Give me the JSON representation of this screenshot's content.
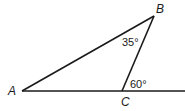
{
  "diagram": {
    "type": "geometry-triangle",
    "vertices": {
      "A": {
        "label": "A",
        "x": 22,
        "y": 91
      },
      "B": {
        "label": "B",
        "x": 154,
        "y": 16
      },
      "C": {
        "label": "C",
        "x": 122,
        "y": 91
      }
    },
    "segments": [
      {
        "from": "A",
        "to": "B"
      },
      {
        "from": "B",
        "to": "C"
      },
      {
        "from": "A",
        "to": "extension",
        "note": "line through A and C extended to the right"
      }
    ],
    "angles": [
      {
        "at": "B",
        "label": "35°",
        "description": "interior angle ABC"
      },
      {
        "at": "C",
        "label": "60°",
        "description": "exterior angle at C between CB and ray extending AC"
      }
    ],
    "colors": {
      "stroke": "#1a1a1a",
      "background": "#ffffff"
    }
  }
}
